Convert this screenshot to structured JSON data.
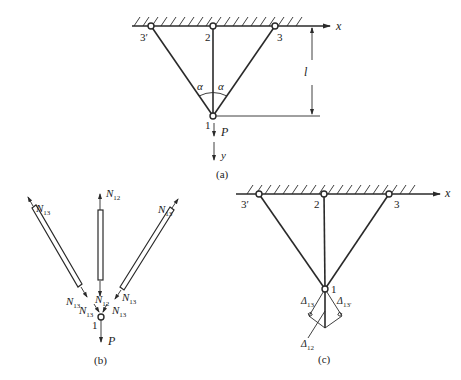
{
  "figure_a": {
    "caption": "(a)",
    "axis_x": "x",
    "axis_y": "y",
    "nodes": {
      "n3p": "3′",
      "n2": "2",
      "n3": "3",
      "n1": "1"
    },
    "angle_left": "α",
    "angle_right": "α",
    "length": "l",
    "load": "P"
  },
  "figure_b": {
    "caption": "(b)",
    "node": "1",
    "load": "P",
    "forces": {
      "left_top": {
        "main": "N",
        "sub": "13"
      },
      "mid_top": {
        "main": "N",
        "sub": "12"
      },
      "right_top": {
        "main": "N",
        "sub": "13"
      },
      "left_bottom": {
        "main": "N",
        "sub": "13"
      },
      "mid_bottom": {
        "main": "N",
        "sub": "12"
      },
      "right_bottom": {
        "main": "N",
        "sub": "13"
      },
      "node_left": {
        "main": "N",
        "sub": "13"
      },
      "node_right": {
        "main": "N",
        "sub": "13"
      }
    }
  },
  "figure_c": {
    "caption": "(c)",
    "axis_x": "x",
    "nodes": {
      "n3p": "3′",
      "n2": "2",
      "n3": "3",
      "n1": "1"
    },
    "delta_13": {
      "main": "Δ",
      "sub": "13"
    },
    "delta_13p": {
      "main": "Δ",
      "sub": "13′"
    },
    "delta_12": {
      "main": "Δ",
      "sub": "12"
    }
  }
}
